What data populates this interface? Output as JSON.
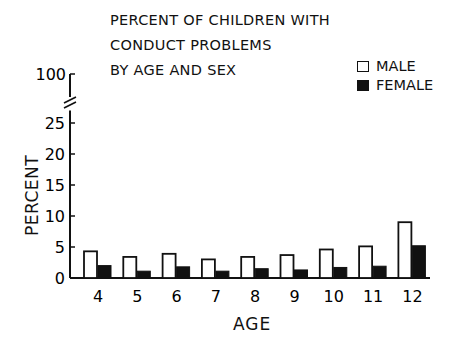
{
  "chart_data": {
    "type": "bar",
    "title": "PERCENT OF CHILDREN WITH CONDUCT PROBLEMS BY AGE AND SEX",
    "title_lines": [
      "PERCENT OF CHILDREN WITH",
      "CONDUCT PROBLEMS",
      "BY AGE AND SEX"
    ],
    "xlabel": "AGE",
    "ylabel": "PERCENT",
    "categories": [
      "4",
      "5",
      "6",
      "7",
      "8",
      "9",
      "10",
      "11",
      "12"
    ],
    "series": [
      {
        "name": "MALE",
        "fill": "#ffffff",
        "values": [
          4.3,
          3.4,
          3.9,
          3.0,
          3.4,
          3.7,
          4.6,
          5.1,
          9.0
        ]
      },
      {
        "name": "FEMALE",
        "fill": "#111111",
        "values": [
          2.0,
          1.1,
          1.8,
          1.1,
          1.5,
          1.3,
          1.7,
          1.9,
          5.2
        ]
      }
    ],
    "yticks": [
      "0",
      "5",
      "10",
      "15",
      "20",
      "25",
      "100"
    ],
    "ylim": [
      0,
      100
    ],
    "axis_break": "between 25 and 100",
    "grid": false,
    "legend_position": "top-right"
  }
}
